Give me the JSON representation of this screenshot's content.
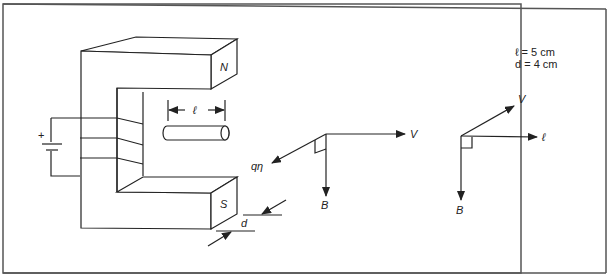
{
  "figure": {
    "magnet": {
      "north_label": "N",
      "south_label": "S",
      "battery_plus": "+"
    },
    "rod": {
      "length_label": "ℓ"
    },
    "gap": {
      "depth_label": "d"
    },
    "vector_diagram_left": {
      "v_label": "V",
      "b_label": "B",
      "force_label": "qη"
    },
    "vector_diagram_right": {
      "v_label": "V",
      "l_label": "ℓ",
      "b_label": "B"
    },
    "given": {
      "line1": "ℓ = 5 cm",
      "line2": "d = 4 cm"
    }
  }
}
